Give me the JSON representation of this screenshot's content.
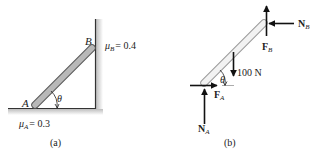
{
  "figure_a": {
    "caption": "(a)",
    "point_a_label": "A",
    "point_b_label": "B",
    "angle_label": "θ",
    "mu_b": {
      "symbol": "μ",
      "subscript": "B",
      "value": "= 0.4"
    },
    "mu_a": {
      "symbol": "μ",
      "subscript": "A",
      "value": "= 0.3"
    }
  },
  "figure_b": {
    "caption": "(b)",
    "angle_label": "θ",
    "weight_label": "100 N",
    "forces": {
      "n_b": {
        "symbol": "N",
        "subscript": "B"
      },
      "f_b": {
        "symbol": "F",
        "subscript": "B"
      },
      "f_a": {
        "symbol": "F",
        "subscript": "A"
      },
      "n_a": {
        "symbol": "N",
        "subscript": "A"
      }
    }
  },
  "colors": {
    "rod_fill": "#b8b8b8",
    "rod_stroke": "#555555",
    "fbd_rod_fill": "#f2f2f2",
    "fbd_rod_stroke": "#9a9a9a",
    "arrow": "#111111",
    "surface_shade": "#c8c8c8"
  }
}
